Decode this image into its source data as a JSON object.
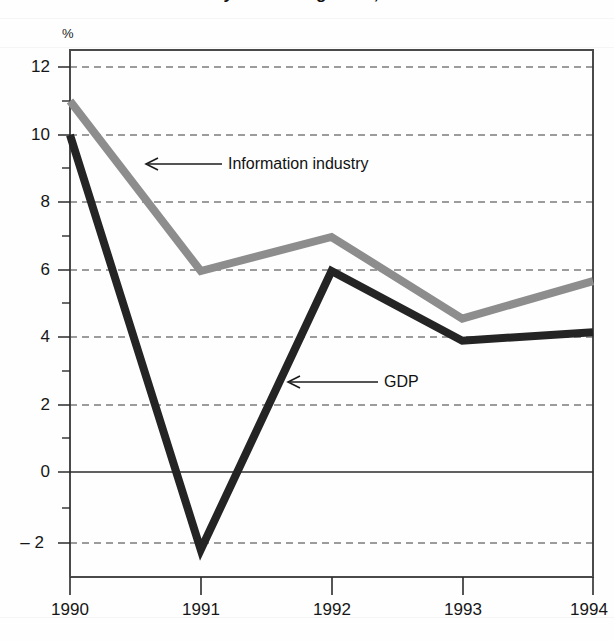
{
  "figure": {
    "title_partial": "Information industry and GDP growth, 1990–1994",
    "unit_label": "%",
    "background_color": "#fefefe"
  },
  "axes": {
    "y_tick_labels": [
      "12",
      "10",
      "8",
      "6",
      "4",
      "2",
      "0",
      "– 2"
    ],
    "y_tick_values": [
      12,
      10,
      8,
      6,
      4,
      2,
      0,
      -2
    ],
    "y_minor_tick_values": [
      11,
      9,
      7,
      5,
      3,
      1,
      -1
    ],
    "x_tick_labels": [
      "1990",
      "1991",
      "1992",
      "1993",
      "1994"
    ],
    "zero_line_value": 0
  },
  "annotations": {
    "series1_label": "Information industry",
    "series2_label": "GDP"
  },
  "colors": {
    "information_industry": "#8d8d8d",
    "gdp": "#242424",
    "grid": "#3a3a3a",
    "frame": "#4a4a4a"
  },
  "chart_data": {
    "type": "line",
    "title": "Information industry and GDP growth, 1990–1994",
    "xlabel": "",
    "ylabel": "%",
    "x": [
      1990,
      1991,
      1992,
      1993,
      1994
    ],
    "categories": [
      "1990",
      "1991",
      "1992",
      "1993",
      "1994"
    ],
    "ylim": [
      -2.6,
      12.8
    ],
    "yticks": [
      -2,
      0,
      2,
      4,
      6,
      8,
      10,
      12
    ],
    "grid": true,
    "grid_style": "dashed-horizontal",
    "legend": "annotated-inline",
    "series": [
      {
        "name": "Information industry",
        "color": "#8d8d8d",
        "values": [
          11.0,
          6.0,
          7.0,
          4.6,
          5.7
        ]
      },
      {
        "name": "GDP",
        "color": "#242424",
        "values": [
          10.0,
          -2.2,
          6.0,
          3.95,
          4.2
        ]
      }
    ]
  }
}
